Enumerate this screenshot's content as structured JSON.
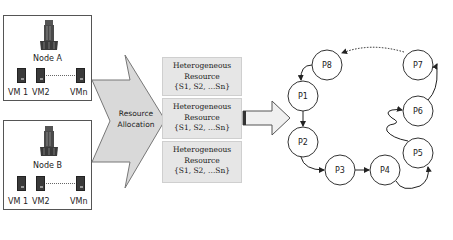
{
  "nodes": [
    {
      "label": "Node A",
      "vms": [
        "VM 1",
        "VM2",
        "VMn"
      ]
    },
    {
      "label": "Node B",
      "vms": [
        "VM 1",
        "VM2",
        "VMn"
      ]
    }
  ],
  "allocation": {
    "line1": "Resource",
    "line2": "Allocation"
  },
  "resources": [
    {
      "line1": "Heterogeneous",
      "line2": "Resource",
      "line3": "{S1, S2, ...Sn}"
    },
    {
      "line1": "Heterogeneous",
      "line2": "Resource",
      "line3": "{S1, S2, ...Sn}"
    },
    {
      "line1": "Heterogeneous",
      "line2": "Resource",
      "line3": "{S1, S2, ...Sn}"
    }
  ],
  "processes": [
    "P1",
    "P2",
    "P3",
    "P4",
    "P5",
    "P6",
    "P7",
    "P8"
  ],
  "colors": {
    "arrow_fill": "#d9d9d9",
    "arrow_stroke": "#777777",
    "resource_fill": "#e6e6e6",
    "circle_stroke": "#333333",
    "vm_fill": "#3a3a3a"
  }
}
